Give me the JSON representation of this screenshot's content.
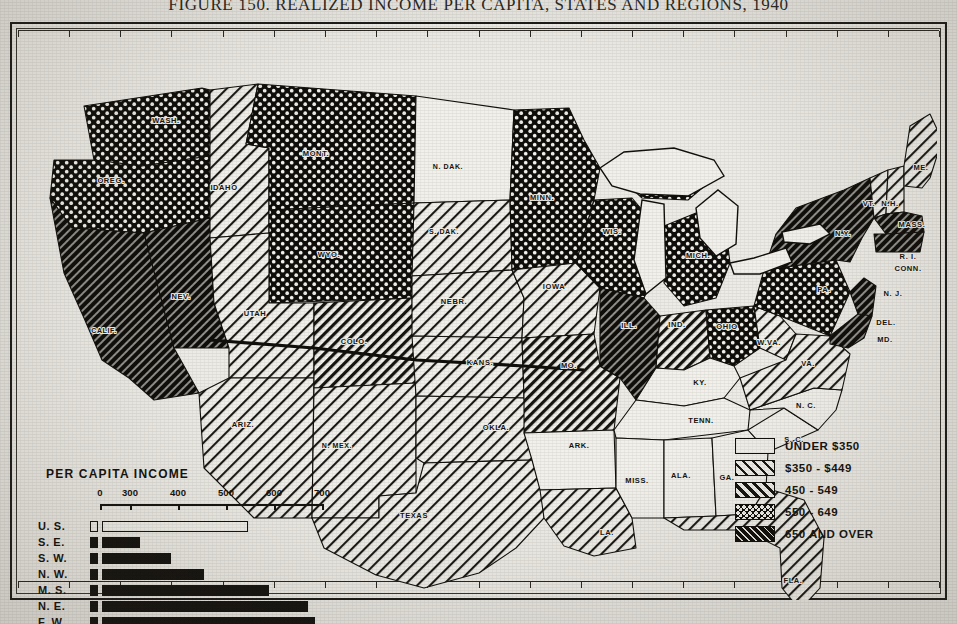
{
  "figure": {
    "title": "FIGURE 150.  REALIZED INCOME PER CAPITA, STATES AND REGIONS, 1940"
  },
  "legend": {
    "items": [
      {
        "label": "UNDER $350",
        "pattern": "solid-white"
      },
      {
        "label": "$350 - $449",
        "pattern": "light-hatch"
      },
      {
        "label": "450 -  549",
        "pattern": "medium-hatch"
      },
      {
        "label": "550 -  649",
        "pattern": "cross-hatch"
      },
      {
        "label": "650 AND OVER",
        "pattern": "dark-hatch"
      }
    ]
  },
  "inset": {
    "title": "PER CAPITA INCOME"
  },
  "chart_data": {
    "type": "bar",
    "title": "PER CAPITA INCOME",
    "orientation": "horizontal",
    "categories": [
      "U. S.",
      "S. E.",
      "S. W.",
      "N. W.",
      "M. S.",
      "N. E.",
      "F. W."
    ],
    "values": [
      545,
      320,
      385,
      455,
      590,
      670,
      685
    ],
    "xlabel": "",
    "ylabel": "",
    "xticks": [
      0,
      300,
      400,
      500,
      600,
      700
    ],
    "xtick_labels": [
      "0",
      "300",
      "400",
      "500",
      "600",
      "700"
    ],
    "axis_break": "between 0 and 300",
    "xlim": [
      0,
      700
    ],
    "grid": false,
    "legend": "none",
    "bar_styles": [
      "hollow",
      "solid",
      "solid",
      "solid",
      "solid",
      "solid",
      "solid"
    ],
    "note": "U. S. bar drawn hollow (outline); regional bars solid black"
  },
  "map": {
    "states": [
      {
        "abbr": "WASH.",
        "cls": "cross",
        "lx": 142,
        "ly": 75
      },
      {
        "abbr": "OREG.",
        "cls": "cross",
        "lx": 87,
        "ly": 135
      },
      {
        "abbr": "CALIF.",
        "cls": "dark",
        "lx": 80,
        "ly": 285
      },
      {
        "abbr": "NEV.",
        "cls": "dark",
        "lx": 157,
        "ly": 251
      },
      {
        "abbr": "IDAHO",
        "cls": "light",
        "lx": 200,
        "ly": 142
      },
      {
        "abbr": "MONT.",
        "cls": "cross",
        "lx": 292,
        "ly": 108
      },
      {
        "abbr": "WYO.",
        "cls": "cross",
        "lx": 305,
        "ly": 209
      },
      {
        "abbr": "UTAH",
        "cls": "light",
        "lx": 231,
        "ly": 268
      },
      {
        "abbr": "ARIZ.",
        "cls": "light",
        "lx": 219,
        "ly": 379
      },
      {
        "abbr": "COLO.",
        "cls": "med",
        "lx": 330,
        "ly": 296
      },
      {
        "abbr": "N. MEX.",
        "cls": "light",
        "lx": 313,
        "ly": 400
      },
      {
        "abbr": "N. DAK.",
        "cls": "white",
        "lx": 424,
        "ly": 121
      },
      {
        "abbr": "S. DAK.",
        "cls": "light",
        "lx": 420,
        "ly": 186
      },
      {
        "abbr": "NEBR.",
        "cls": "light",
        "lx": 430,
        "ly": 256
      },
      {
        "abbr": "KANS.",
        "cls": "light",
        "lx": 456,
        "ly": 317
      },
      {
        "abbr": "OKLA.",
        "cls": "light",
        "lx": 472,
        "ly": 382
      },
      {
        "abbr": "TEXAS",
        "cls": "light",
        "lx": 390,
        "ly": 470
      },
      {
        "abbr": "MINN.",
        "cls": "cross",
        "lx": 518,
        "ly": 152
      },
      {
        "abbr": "IOWA",
        "cls": "light",
        "lx": 530,
        "ly": 241
      },
      {
        "abbr": "MO.",
        "cls": "med",
        "lx": 545,
        "ly": 320
      },
      {
        "abbr": "ARK.",
        "cls": "white",
        "lx": 555,
        "ly": 400
      },
      {
        "abbr": "LA.",
        "cls": "light",
        "lx": 583,
        "ly": 487
      },
      {
        "abbr": "WIS.",
        "cls": "cross",
        "lx": 588,
        "ly": 186
      },
      {
        "abbr": "ILL.",
        "cls": "dark",
        "lx": 605,
        "ly": 280
      },
      {
        "abbr": "MISS.",
        "cls": "white",
        "lx": 613,
        "ly": 435
      },
      {
        "abbr": "ALA.",
        "cls": "white",
        "lx": 657,
        "ly": 430
      },
      {
        "abbr": "MICH.",
        "cls": "cross",
        "lx": 674,
        "ly": 210
      },
      {
        "abbr": "IND.",
        "cls": "med",
        "lx": 653,
        "ly": 279
      },
      {
        "abbr": "KY.",
        "cls": "white",
        "lx": 676,
        "ly": 337
      },
      {
        "abbr": "TENN.",
        "cls": "white",
        "lx": 677,
        "ly": 375
      },
      {
        "abbr": "GA.",
        "cls": "white",
        "lx": 703,
        "ly": 432
      },
      {
        "abbr": "FLA.",
        "cls": "light",
        "lx": 769,
        "ly": 535
      },
      {
        "abbr": "OHIO",
        "cls": "cross",
        "lx": 703,
        "ly": 281
      },
      {
        "abbr": "W.VA.",
        "cls": "light",
        "lx": 745,
        "ly": 297
      },
      {
        "abbr": "VA.",
        "cls": "light",
        "lx": 784,
        "ly": 318
      },
      {
        "abbr": "N. C.",
        "cls": "white",
        "lx": 782,
        "ly": 360
      },
      {
        "abbr": "S. C.",
        "cls": "white",
        "lx": 770,
        "ly": 394
      },
      {
        "abbr": "PA.",
        "cls": "cross",
        "lx": 800,
        "ly": 244
      },
      {
        "abbr": "N.Y.",
        "cls": "dark",
        "lx": 819,
        "ly": 188
      },
      {
        "abbr": "VT.",
        "cls": "light",
        "lx": 845,
        "ly": 158
      },
      {
        "abbr": "N.H.",
        "cls": "light",
        "lx": 866,
        "ly": 158
      },
      {
        "abbr": "ME.",
        "cls": "light",
        "lx": 897,
        "ly": 122
      },
      {
        "abbr": "MASS.",
        "cls": "dark",
        "lx": 888,
        "ly": 179
      },
      {
        "abbr": "R. I.",
        "cls": "dark",
        "lx": 884,
        "ly": 211
      },
      {
        "abbr": "CONN.",
        "cls": "dark",
        "lx": 884,
        "ly": 223
      },
      {
        "abbr": "N. J.",
        "cls": "dark",
        "lx": 869,
        "ly": 248
      },
      {
        "abbr": "DEL.",
        "cls": "dark",
        "lx": 862,
        "ly": 277
      },
      {
        "abbr": "MD.",
        "cls": "dark",
        "lx": 861,
        "ly": 294
      }
    ]
  },
  "colors": {
    "ink": "#15130f",
    "paper": "#edebe5",
    "border": "#1d1b18"
  }
}
